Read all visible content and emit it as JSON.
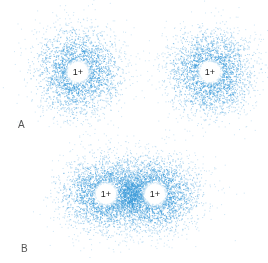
{
  "colors": {
    "electron_dot": "#3a9ad9",
    "nucleus_fill": "#ffffff",
    "label": "#555555"
  },
  "panels": [
    {
      "label": "A",
      "label_pos": [
        18,
        119
      ],
      "description": "two separate hydrogen atoms with spherical electron clouds",
      "nuclei": [
        {
          "charge": "1+",
          "x": 78,
          "y": 72
        },
        {
          "charge": "1+",
          "x": 210,
          "y": 72
        }
      ],
      "clouds": [
        {
          "cx": 78,
          "cy": 72,
          "rx": 48,
          "ry": 48,
          "n": 2600
        },
        {
          "cx": 210,
          "cy": 72,
          "rx": 48,
          "ry": 48,
          "n": 2600
        }
      ]
    },
    {
      "label": "B",
      "label_pos": [
        21,
        243
      ],
      "description": "H2 molecule with shared electron cloud",
      "nuclei": [
        {
          "charge": "1+",
          "x": 106,
          "y": 194
        },
        {
          "charge": "1+",
          "x": 155,
          "y": 194
        }
      ],
      "clouds": [
        {
          "cx": 106,
          "cy": 194,
          "rx": 50,
          "ry": 42,
          "n": 2600
        },
        {
          "cx": 155,
          "cy": 194,
          "rx": 50,
          "ry": 42,
          "n": 2600
        },
        {
          "cx": 131,
          "cy": 194,
          "rx": 18,
          "ry": 26,
          "n": 700
        }
      ]
    }
  ]
}
